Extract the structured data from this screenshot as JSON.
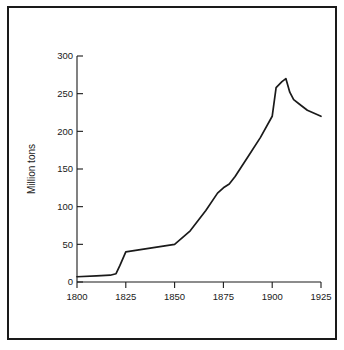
{
  "figure": {
    "border_color": "#1a1a1a",
    "background_color": "#ffffff",
    "line_color": "#1a1a1a"
  },
  "chart_data": {
    "type": "line",
    "title": "",
    "subtitle": "",
    "xlabel": "",
    "ylabel": "Million tons",
    "xlim": [
      1800,
      1925
    ],
    "ylim": [
      0,
      300
    ],
    "grid": false,
    "legend": false,
    "legend_position": "none",
    "x_ticks": [
      1800,
      1825,
      1850,
      1875,
      1900,
      1925
    ],
    "x_tick_labels": [
      "1800",
      "1825",
      "1850",
      "1875",
      "1900",
      "1925"
    ],
    "y_ticks": [
      0,
      50,
      100,
      150,
      200,
      250,
      300
    ],
    "y_tick_labels": [
      "0",
      "50",
      "100",
      "150",
      "200",
      "250",
      "300"
    ],
    "series": [
      {
        "name": "Production",
        "x": [
          1800,
          1810,
          1817,
          1820,
          1822,
          1825,
          1830,
          1840,
          1850,
          1858,
          1866,
          1872,
          1875,
          1878,
          1881,
          1888,
          1894,
          1900,
          1902,
          1905,
          1907,
          1909,
          1911,
          1914,
          1918,
          1925
        ],
        "values": [
          7,
          8,
          9,
          11,
          22,
          40,
          42,
          46,
          50,
          68,
          95,
          118,
          125,
          130,
          140,
          168,
          192,
          220,
          258,
          266,
          270,
          252,
          242,
          236,
          228,
          220
        ]
      }
    ],
    "annotations": []
  },
  "axis_title": {
    "y": "Million tons"
  }
}
